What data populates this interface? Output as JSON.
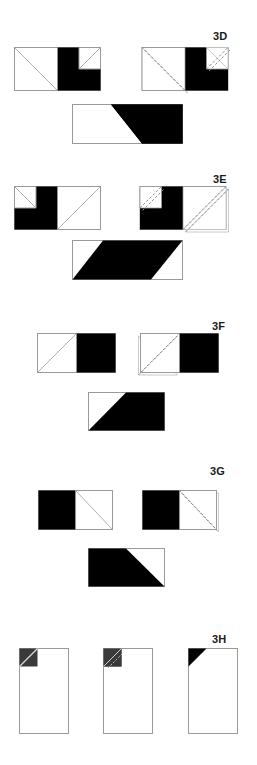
{
  "document": {
    "kind": "paper-folding-puzzle-sheet",
    "background_color": "#ffffff",
    "ink_color": "#000000",
    "outline_color": "#9a9a9a",
    "fold_line_color": "#8c8c8c",
    "label_color": "#1a1a1a",
    "width": 257,
    "height": 765
  },
  "problems": [
    {
      "id": "3D",
      "label": "3D",
      "label_x": 213,
      "label_y": 31,
      "steps": [
        {
          "name": "unfolded-sheet",
          "x": 14,
          "y": 47,
          "w": 86,
          "h": 43,
          "description": "two-square rectangle: left square outlined with diagonal from top-left to bottom-right, right square solid black with white notched square at top-right corner containing a diagonal"
        },
        {
          "name": "fold-indicated-sheet",
          "x": 138,
          "y": 47,
          "w": 86,
          "h": 43,
          "description": "same figure annotated with dashed diagonal fold lines and ghosted flap outlines on the lower-left and upper-right"
        },
        {
          "name": "folded-result",
          "x": 72,
          "y": 104,
          "w": 110,
          "h": 39,
          "description": "black parallelogram filling a light rectangle, slanting down to the left"
        }
      ]
    },
    {
      "id": "3E",
      "label": "3E",
      "label_x": 213,
      "label_y": 174,
      "steps": [
        {
          "name": "unfolded-sheet",
          "x": 14,
          "y": 186,
          "w": 86,
          "h": 43,
          "description": "two-square rectangle: left portion solid black with white notched square at top-left corner containing a diagonal, right square outlined with diagonal from bottom-left to top-right"
        },
        {
          "name": "fold-indicated-sheet",
          "x": 138,
          "y": 186,
          "w": 86,
          "h": 43,
          "description": "same figure annotated with dashed diagonal fold lines and ghosted flap outlines on the upper-left and lower-right"
        },
        {
          "name": "folded-result",
          "x": 72,
          "y": 240,
          "w": 110,
          "h": 39,
          "description": "black parallelogram filling a light rectangle, slanting down to the right"
        }
      ]
    },
    {
      "id": "3F",
      "label": "3F",
      "label_x": 212,
      "label_y": 321,
      "steps": [
        {
          "name": "unfolded-sheet",
          "x": 37,
          "y": 333,
          "w": 78,
          "h": 39,
          "description": "two-square rectangle: left square outlined with diagonal from bottom-left to top-right, right square solid black"
        },
        {
          "name": "fold-indicated-sheet",
          "x": 140,
          "y": 333,
          "w": 78,
          "h": 39,
          "description": "same figure with dashed diagonal fold line across the left square and ghosted folded flap below-left"
        },
        {
          "name": "folded-result",
          "x": 88,
          "y": 392,
          "w": 76,
          "h": 38,
          "description": "rectangle with black region below a diagonal running from top-centre to bottom-left"
        }
      ]
    },
    {
      "id": "3G",
      "label": "3G",
      "label_x": 210,
      "label_y": 466,
      "steps": [
        {
          "name": "unfolded-sheet",
          "x": 38,
          "y": 490,
          "w": 74,
          "h": 39,
          "description": "two-square rectangle: left square solid black, right square outlined with diagonal from top-left to bottom-right"
        },
        {
          "name": "fold-indicated-sheet",
          "x": 139,
          "y": 490,
          "w": 74,
          "h": 39,
          "description": "same figure with dashed diagonal fold line across the right square and ghosted folded flap below-right"
        },
        {
          "name": "folded-result",
          "x": 88,
          "y": 548,
          "w": 76,
          "h": 38,
          "description": "rectangle with black trapezoid filling the left and bottom, diagonal running from top-centre down to bottom-right"
        }
      ]
    },
    {
      "id": "3H",
      "label": "3H",
      "label_x": 212,
      "label_y": 634,
      "steps": [
        {
          "name": "unfolded-sheet",
          "x": 19,
          "y": 648,
          "w": 49,
          "h": 85,
          "description": "tall portrait rectangle with a small dark grey square at the top-left corner crossed by a light diagonal"
        },
        {
          "name": "fold-indicated-sheet",
          "x": 103,
          "y": 648,
          "w": 49,
          "h": 85,
          "description": "tall portrait rectangle with a dark grey corner square and a dashed diagonal fold flap pointing to the upper-right"
        },
        {
          "name": "folded-result",
          "x": 188,
          "y": 648,
          "w": 49,
          "h": 85,
          "description": "tall portrait rectangle with a solid black triangle filling the top-left corner"
        }
      ]
    }
  ]
}
